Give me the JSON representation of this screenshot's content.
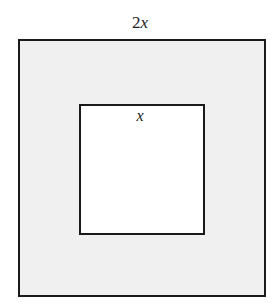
{
  "diagram": {
    "outer_square": {
      "label_coef": "2",
      "label_var": "x",
      "fill": "#f0f0f0",
      "stroke": "#1a1a1a"
    },
    "inner_square": {
      "label_var": "x",
      "fill": "#ffffff",
      "stroke": "#1a1a1a"
    }
  }
}
